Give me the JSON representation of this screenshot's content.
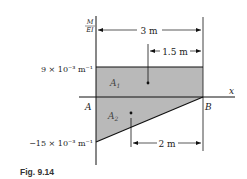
{
  "figure": {
    "caption": "Fig. 9.14",
    "y_axis_label_top": "M",
    "y_axis_label_bottom": "EI",
    "x_axis_label": "x",
    "point_a": "A",
    "point_b": "B",
    "upper_value_label": "9 × 10⁻³ m⁻¹",
    "lower_value_label": "−15 × 10⁻³ m⁻¹",
    "area_1_label": "A",
    "area_1_sub": "1",
    "area_2_label": "A",
    "area_2_sub": "2",
    "dim_total": "3 m",
    "dim_centroid_1": "1.5 m",
    "dim_centroid_2": "2 m",
    "fill_color": "#b9b9b9",
    "line_color": "#111111"
  }
}
